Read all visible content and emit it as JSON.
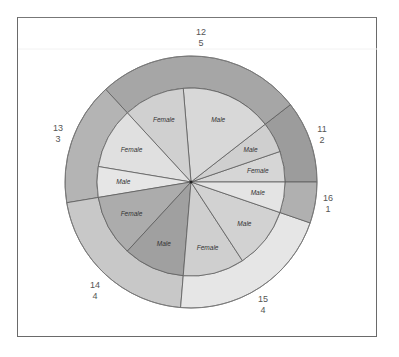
{
  "chart_data": {
    "type": "pie",
    "subtype": "nested-donut",
    "title": "",
    "start_angle_deg": 0,
    "direction": "counterclockwise",
    "outer_ring": {
      "dimension": "age",
      "slices": [
        {
          "label": "11",
          "value": 2,
          "color": "#9c9c9c",
          "label_pos": [
            322,
            132
          ]
        },
        {
          "label": "12",
          "value": 5,
          "color": "#a6a6a6",
          "label_pos": [
            201,
            35
          ]
        },
        {
          "label": "13",
          "value": 3,
          "color": "#b4b4b4",
          "label_pos": [
            58,
            131
          ]
        },
        {
          "label": "14",
          "value": 4,
          "color": "#c8c8c8",
          "label_pos": [
            95,
            288
          ]
        },
        {
          "label": "15",
          "value": 4,
          "color": "#e6e6e6",
          "label_pos": [
            263,
            302
          ]
        },
        {
          "label": "16",
          "value": 1,
          "color": "#b0b0b0",
          "label_pos": [
            328,
            201
          ]
        }
      ]
    },
    "inner_ring": {
      "dimension": "sex",
      "slices": [
        {
          "age": "11",
          "label": "Female",
          "value": 1,
          "color": "#d6d6d6"
        },
        {
          "age": "11",
          "label": "Male",
          "value": 1,
          "color": "#cfcfcf"
        },
        {
          "age": "12",
          "label": "Male",
          "value": 3,
          "color": "#d8d8d8"
        },
        {
          "age": "12",
          "label": "Female",
          "value": 2,
          "color": "#d0d0d0"
        },
        {
          "age": "13",
          "label": "Female",
          "value": 2,
          "color": "#e0e0e0"
        },
        {
          "age": "13",
          "label": "Male",
          "value": 1,
          "color": "#e6e6e6"
        },
        {
          "age": "14",
          "label": "Female",
          "value": 2,
          "color": "#acacac"
        },
        {
          "age": "14",
          "label": "Male",
          "value": 2,
          "color": "#a0a0a0"
        },
        {
          "age": "15",
          "label": "Female",
          "value": 2,
          "color": "#cfcfcf"
        },
        {
          "age": "15",
          "label": "Male",
          "value": 2,
          "color": "#d2d2d2"
        },
        {
          "age": "16",
          "label": "Male",
          "value": 1,
          "color": "#e4e4e4"
        }
      ]
    },
    "total": 19,
    "legend": "none",
    "grid": false
  },
  "geometry": {
    "cx": 191,
    "cy": 182,
    "r_outer": 126,
    "r_inner": 94,
    "stroke": "#5c5c5c"
  }
}
